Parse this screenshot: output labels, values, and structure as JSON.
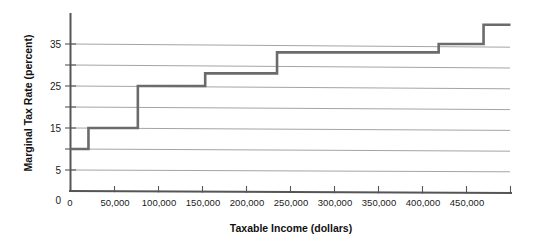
{
  "chart_data": {
    "type": "line",
    "subtype": "step",
    "title": "",
    "xlabel": "Taxable Income (dollars)",
    "ylabel": "Marginal Tax Rate (percent)",
    "xlim": [
      0,
      490000
    ],
    "ylim": [
      0,
      41
    ],
    "grid": true,
    "legend": false,
    "xticks": [
      0,
      50000,
      100000,
      150000,
      200000,
      250000,
      300000,
      350000,
      400000,
      450000
    ],
    "xticklabels": [
      "0",
      "50,000",
      "100,000",
      "150,000",
      "200,000",
      "250,000",
      "300,000",
      "350,000",
      "400,000",
      "450,000"
    ],
    "yticks": [
      0,
      5,
      15,
      25,
      35
    ],
    "yticklabels": [
      "0",
      "5",
      "15",
      "25",
      "35"
    ],
    "ygridlines": [
      5,
      10,
      15,
      20,
      25,
      30,
      35
    ],
    "series": [
      {
        "name": "Marginal tax rate",
        "step_brackets": [
          {
            "x_start": 0,
            "x_end": 20000,
            "rate": 10.0
          },
          {
            "x_start": 20000,
            "x_end": 75000,
            "rate": 15.0
          },
          {
            "x_start": 75000,
            "x_end": 150000,
            "rate": 25.0
          },
          {
            "x_start": 150000,
            "x_end": 230000,
            "rate": 28.0
          },
          {
            "x_start": 230000,
            "x_end": 410000,
            "rate": 33.0
          },
          {
            "x_start": 410000,
            "x_end": 460000,
            "rate": 35.0
          },
          {
            "x_start": 460000,
            "x_end": 490000,
            "rate": 39.6
          }
        ]
      }
    ],
    "colors": {
      "line": "#6b6b6b",
      "grid": "#9a9a9a",
      "axis": "#555555",
      "text": "#1a1a1a",
      "background": "#ffffff"
    }
  },
  "axis": {
    "x_title": "Taxable Income (dollars)",
    "y_title": "Marginal Tax Rate (percent)"
  }
}
